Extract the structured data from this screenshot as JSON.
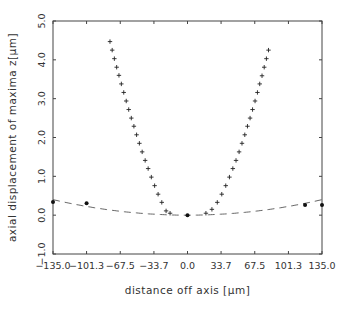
{
  "chart_data": {
    "type": "scatter",
    "title": "",
    "xlabel": "distance off axis [μm]",
    "ylabel": "axial displacement of maxima z[μm]",
    "xlim": [
      -135.0,
      135.0
    ],
    "ylim": [
      -1.0,
      5.0
    ],
    "grid": false,
    "legend": null,
    "x_ticks": [
      "-135.0",
      "-101.3",
      "-67.5",
      "-33.7",
      "0.0",
      "33.7",
      "67.5",
      "101.3",
      "135.0"
    ],
    "x_tick_values": [
      -135.0,
      -101.3,
      -67.5,
      -33.7,
      0.0,
      33.7,
      67.5,
      101.3,
      135.0
    ],
    "y_ticks": [
      "-1.0",
      "0.0",
      "1.0",
      "2.0",
      "3.0",
      "4.0",
      "5.0"
    ],
    "y_tick_values": [
      -1.0,
      0.0,
      1.0,
      2.0,
      3.0,
      4.0,
      5.0
    ],
    "series": [
      {
        "name": "plus-markers-left-branch",
        "marker": "plus",
        "note": "endpoints read from image; intermediate points are estimated by fitting a smooth curve, not measured individually",
        "x": [
          -77.8,
          -75.6,
          -73.4,
          -71.1,
          -68.8,
          -66.4,
          -64.0,
          -61.5,
          -59.0,
          -56.4,
          -53.8,
          -51.1,
          -48.3,
          -45.5,
          -42.5,
          -39.5,
          -36.3,
          -33.0,
          -29.5,
          -25.8,
          -21.5,
          -17.5
        ],
        "y": [
          4.47,
          4.25,
          4.03,
          3.81,
          3.6,
          3.38,
          3.16,
          2.94,
          2.72,
          2.5,
          2.29,
          2.07,
          1.85,
          1.63,
          1.41,
          1.2,
          0.98,
          0.76,
          0.54,
          0.33,
          0.11,
          0.05
        ]
      },
      {
        "name": "plus-markers-right-branch",
        "marker": "plus",
        "note": "endpoints read from image; intermediate points are estimated by fitting a smooth curve, not measured individually",
        "x": [
          81.3,
          79.2,
          77.0,
          74.8,
          72.5,
          70.2,
          67.8,
          65.3,
          62.8,
          60.2,
          57.5,
          54.7,
          51.8,
          48.7,
          45.5,
          42.1,
          38.4,
          34.4,
          29.9,
          24.5,
          18.5
        ],
        "y": [
          4.25,
          4.03,
          3.81,
          3.59,
          3.38,
          3.16,
          2.94,
          2.72,
          2.5,
          2.29,
          2.07,
          1.85,
          1.63,
          1.41,
          1.2,
          0.98,
          0.76,
          0.54,
          0.33,
          0.15,
          0.05
        ]
      },
      {
        "name": "filled-dots",
        "marker": "dot",
        "x": [
          -135.0,
          -101.3,
          0.0,
          118.0,
          135.0
        ],
        "y": [
          0.34,
          0.31,
          0.0,
          0.26,
          0.26
        ]
      },
      {
        "name": "dashed-fit-curve",
        "marker": "none",
        "line": "dashed",
        "x": [
          -135,
          -120,
          -100,
          -80,
          -60,
          -40,
          -20,
          0,
          20,
          40,
          60,
          80,
          100,
          120,
          135
        ],
        "y": [
          0.4,
          0.32,
          0.22,
          0.14,
          0.08,
          0.035,
          0.01,
          0.0,
          0.01,
          0.035,
          0.08,
          0.14,
          0.22,
          0.32,
          0.4
        ]
      }
    ]
  },
  "style": {
    "axis_color": "#444444",
    "marker_color": "#222222",
    "curve_color": "#555555",
    "background": "#ffffff"
  }
}
